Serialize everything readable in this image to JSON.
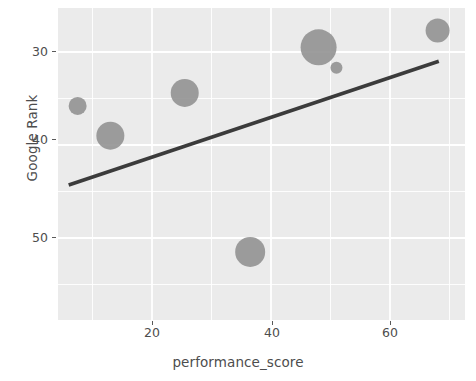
{
  "chart_data": {
    "type": "scatter",
    "title": "",
    "xlabel": "performance_score",
    "ylabel": "Google Rank",
    "xlim": [
      3,
      71
    ],
    "ylim_display": [
      25.5,
      59
    ],
    "y_axis_reversed": true,
    "grid": true,
    "legend": false,
    "xticks": [
      20,
      40,
      60
    ],
    "yticks": [
      30,
      40,
      50
    ],
    "point_color": "#8f8f8f",
    "line_color": "#3b3b3b",
    "panel_color": "#ebebeb",
    "grid_color": "#ffffff",
    "points": [
      {
        "x": 7.5,
        "y": 35.8,
        "size": 9
      },
      {
        "x": 13.0,
        "y": 39.0,
        "size": 14
      },
      {
        "x": 25.5,
        "y": 34.4,
        "size": 14
      },
      {
        "x": 36.5,
        "y": 51.5,
        "size": 15
      },
      {
        "x": 48.0,
        "y": 29.5,
        "size": 18
      },
      {
        "x": 51.0,
        "y": 31.7,
        "size": 6
      },
      {
        "x": 68.0,
        "y": 27.7,
        "size": 12
      }
    ],
    "trend_line": {
      "x_start": 6.0,
      "y_start": 44.3,
      "x_end": 68.2,
      "y_end": 31.0
    }
  },
  "axis": {
    "y_tick_labels": [
      "30",
      "40",
      "50"
    ],
    "x_tick_labels": [
      "20",
      "40",
      "60"
    ],
    "y_title": "Google Rank",
    "x_title": "performance_score"
  }
}
